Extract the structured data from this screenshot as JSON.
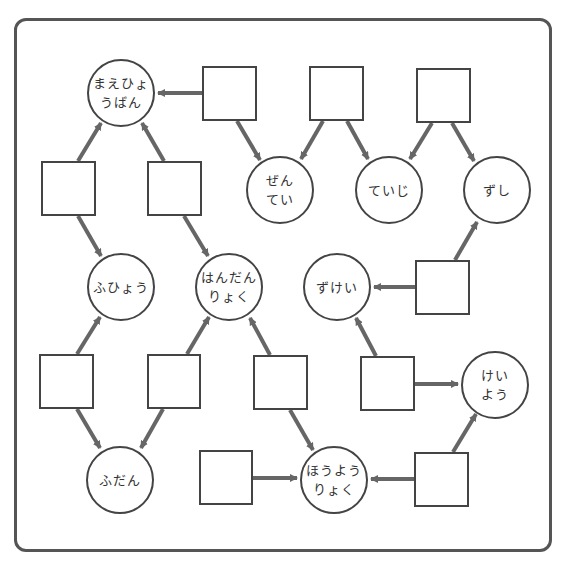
{
  "diagram": {
    "colors": {
      "frame": "#555555",
      "arrow": "#666666",
      "node_border": "#444444",
      "text": "#333333"
    },
    "circles": [
      {
        "id": "c1",
        "lines": [
          "まえひょ",
          "うばん"
        ],
        "cx": 121,
        "cy": 93,
        "r": 34
      },
      {
        "id": "c2",
        "lines": [
          "ぜん",
          "てい"
        ],
        "cx": 280,
        "cy": 190,
        "r": 34
      },
      {
        "id": "c3",
        "lines": [
          "ていじ"
        ],
        "cx": 389,
        "cy": 190,
        "r": 34
      },
      {
        "id": "c4",
        "lines": [
          "ずし"
        ],
        "cx": 497,
        "cy": 190,
        "r": 34
      },
      {
        "id": "c5",
        "lines": [
          "ふひょう"
        ],
        "cx": 121,
        "cy": 287,
        "r": 34
      },
      {
        "id": "c6",
        "lines": [
          "はんだん",
          "りょく"
        ],
        "cx": 229,
        "cy": 287,
        "r": 34
      },
      {
        "id": "c7",
        "lines": [
          "ずけい"
        ],
        "cx": 337,
        "cy": 287,
        "r": 34
      },
      {
        "id": "c8",
        "lines": [
          "けい",
          "よう"
        ],
        "cx": 495,
        "cy": 385,
        "r": 34
      },
      {
        "id": "c9",
        "lines": [
          "ふだん"
        ],
        "cx": 120,
        "cy": 480,
        "r": 34
      },
      {
        "id": "c10",
        "lines": [
          "ほうよう",
          "りょく"
        ],
        "cx": 334,
        "cy": 480,
        "r": 34
      }
    ],
    "boxes": [
      {
        "id": "b1",
        "x": 202,
        "y": 66,
        "w": 55,
        "h": 55
      },
      {
        "id": "b2",
        "x": 309,
        "y": 66,
        "w": 55,
        "h": 55
      },
      {
        "id": "b3",
        "x": 416,
        "y": 68,
        "w": 55,
        "h": 55
      },
      {
        "id": "b4",
        "x": 41,
        "y": 161,
        "w": 55,
        "h": 55
      },
      {
        "id": "b5",
        "x": 147,
        "y": 161,
        "w": 55,
        "h": 55
      },
      {
        "id": "b6",
        "x": 415,
        "y": 260,
        "w": 55,
        "h": 55
      },
      {
        "id": "b7",
        "x": 39,
        "y": 354,
        "w": 55,
        "h": 55
      },
      {
        "id": "b8",
        "x": 147,
        "y": 354,
        "w": 54,
        "h": 55
      },
      {
        "id": "b9",
        "x": 253,
        "y": 355,
        "w": 55,
        "h": 55
      },
      {
        "id": "b10",
        "x": 360,
        "y": 356,
        "w": 55,
        "h": 55
      },
      {
        "id": "b11",
        "x": 199,
        "y": 450,
        "w": 54,
        "h": 55
      },
      {
        "id": "b12",
        "x": 414,
        "y": 452,
        "w": 55,
        "h": 55
      }
    ],
    "edges": [
      {
        "x1": 202,
        "y1": 93,
        "x2": 158,
        "y2": 93
      },
      {
        "x1": 237,
        "y1": 121,
        "x2": 260,
        "y2": 160
      },
      {
        "x1": 323,
        "y1": 121,
        "x2": 301,
        "y2": 159
      },
      {
        "x1": 347,
        "y1": 121,
        "x2": 368,
        "y2": 159
      },
      {
        "x1": 432,
        "y1": 123,
        "x2": 410,
        "y2": 159
      },
      {
        "x1": 452,
        "y1": 123,
        "x2": 474,
        "y2": 161
      },
      {
        "x1": 78,
        "y1": 161,
        "x2": 101,
        "y2": 123
      },
      {
        "x1": 78,
        "y1": 216,
        "x2": 101,
        "y2": 256
      },
      {
        "x1": 164,
        "y1": 161,
        "x2": 142,
        "y2": 123
      },
      {
        "x1": 184,
        "y1": 216,
        "x2": 208,
        "y2": 256
      },
      {
        "x1": 455,
        "y1": 260,
        "x2": 477,
        "y2": 222
      },
      {
        "x1": 415,
        "y1": 287,
        "x2": 374,
        "y2": 287
      },
      {
        "x1": 77,
        "y1": 354,
        "x2": 100,
        "y2": 317
      },
      {
        "x1": 77,
        "y1": 409,
        "x2": 100,
        "y2": 448
      },
      {
        "x1": 187,
        "y1": 354,
        "x2": 209,
        "y2": 317
      },
      {
        "x1": 163,
        "y1": 409,
        "x2": 141,
        "y2": 448
      },
      {
        "x1": 270,
        "y1": 355,
        "x2": 250,
        "y2": 318
      },
      {
        "x1": 290,
        "y1": 410,
        "x2": 313,
        "y2": 450
      },
      {
        "x1": 376,
        "y1": 356,
        "x2": 356,
        "y2": 318
      },
      {
        "x1": 415,
        "y1": 384,
        "x2": 458,
        "y2": 384
      },
      {
        "x1": 253,
        "y1": 478,
        "x2": 297,
        "y2": 478
      },
      {
        "x1": 414,
        "y1": 479,
        "x2": 371,
        "y2": 479
      },
      {
        "x1": 453,
        "y1": 452,
        "x2": 476,
        "y2": 414
      }
    ]
  }
}
